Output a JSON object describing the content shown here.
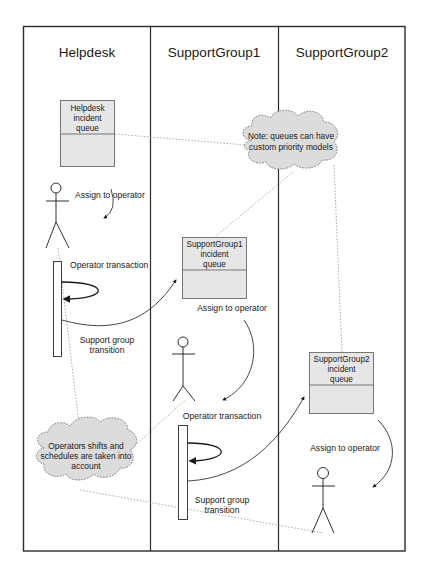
{
  "diagram": {
    "type": "swimlane-sequence",
    "lanes": [
      {
        "title": "Helpdesk"
      },
      {
        "title": "SupportGroup1"
      },
      {
        "title": "SupportGroup2"
      }
    ],
    "queues": [
      {
        "lane": "Helpdesk",
        "lines": [
          "Helpdesk",
          "incident",
          "queue"
        ]
      },
      {
        "lane": "SupportGroup1",
        "lines": [
          "SupportGroup1",
          "incident",
          "queue"
        ]
      },
      {
        "lane": "SupportGroup2",
        "lines": [
          "SupportGroup2",
          "incident",
          "queue"
        ]
      }
    ],
    "labels": {
      "helpdesk_assign": "Assign to operator",
      "helpdesk_transaction": "Operator transaction",
      "helpdesk_transition_1": "Support group",
      "helpdesk_transition_2": "transition",
      "sg1_assign": "Assign to operator",
      "sg1_transaction": "Operator transaction",
      "sg1_transition_1": "Support group",
      "sg1_transition_2": "transition",
      "sg2_assign": "Assign to operator"
    },
    "notes": [
      {
        "id": "priority-note",
        "lines": [
          "Note: queues can have",
          "custom priority models"
        ]
      },
      {
        "id": "shifts-note",
        "lines": [
          "Operators shifts and",
          "schedules are taken into",
          "account"
        ]
      }
    ],
    "colors": {
      "frame": "#2b2b2b",
      "queue_fill": "#e6e6e6",
      "cloud_fill": "#dcdcdc",
      "note_link": "#9a9a9a"
    }
  }
}
